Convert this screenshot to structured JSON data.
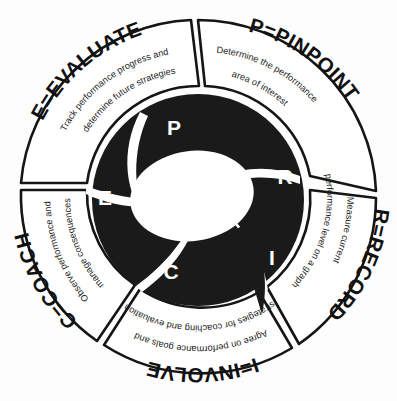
{
  "diagram": {
    "name": "PRICE performance management model",
    "type": "circular-spiral-segments",
    "background_color": "#fdfdfd",
    "ink_color": "#151515",
    "blade_color": "#1a1a1a",
    "letter_color": "#ffffff",
    "segment_count": 5
  },
  "segments": [
    {
      "key": "pinpoint",
      "letter": "P",
      "heading": "P=PINPOINT",
      "desc_line1": "Determine the performance",
      "desc_line2": "area of interest"
    },
    {
      "key": "record",
      "letter": "R",
      "heading": "R=RECORD",
      "desc_line1": "Measure current",
      "desc_line2": "performance level on a graph"
    },
    {
      "key": "involve",
      "letter": "I",
      "heading": "I=INVOLVE",
      "desc_line1": "Agree on performance goals and",
      "desc_line2": "strategies for coaching and evaluation"
    },
    {
      "key": "coach",
      "letter": "C",
      "heading": "C=COACH",
      "desc_line1": "Observe performance and",
      "desc_line2": "manage consequences"
    },
    {
      "key": "evaluate",
      "letter": "E",
      "heading": "E=EVALUATE",
      "desc_line1": "Track performance progress and",
      "desc_line2": "determine future strategies"
    }
  ],
  "core_letters": [
    {
      "letter": "P",
      "x": 174,
      "y": 129
    },
    {
      "letter": "R",
      "x": 285,
      "y": 178
    },
    {
      "letter": "I",
      "x": 272,
      "y": 259
    },
    {
      "letter": "C",
      "x": 171,
      "y": 273
    },
    {
      "letter": "E",
      "x": 105,
      "y": 199
    }
  ]
}
